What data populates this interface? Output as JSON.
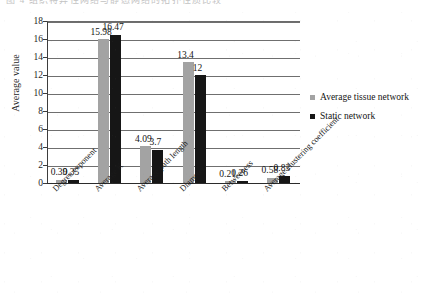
{
  "scan": {
    "top_cutoff_text": "图 4 组织特异性网络与静态网络的拓扑性质比较"
  },
  "chart_data": {
    "type": "bar",
    "title": "",
    "subtitle": "",
    "xlabel": "",
    "ylabel": "Average value",
    "ylim": [
      0,
      18
    ],
    "ytick_step": 2,
    "yticks": [
      0,
      2,
      4,
      6,
      8,
      10,
      12,
      14,
      16,
      18
    ],
    "ytick_labels": [
      "0",
      "2",
      "4",
      "6",
      "8",
      "10",
      "12",
      "14",
      "16",
      "18"
    ],
    "grid": "horizontal",
    "legend_position": "right",
    "categories": [
      "Degree exponent",
      "Average K",
      "Average path length",
      "Diameter",
      "Betweeness",
      "Average clustering coefficient"
    ],
    "series": [
      {
        "name": "Average tissue network",
        "color": "#a3a3a3",
        "values": [
          0.39,
          15.98,
          4.09,
          13.4,
          0.21,
          0.58
        ],
        "labels": [
          "0.39",
          "15.98",
          "4.09",
          "13.4",
          "0.21",
          "0.58"
        ]
      },
      {
        "name": "Static network",
        "color": "#161616",
        "values": [
          0.35,
          16.47,
          3.7,
          12,
          0.26,
          0.83
        ],
        "labels": [
          "0.35",
          "16.47",
          "3.7",
          "12",
          "0.26",
          "0.83"
        ]
      }
    ]
  },
  "legend": {
    "items": [
      {
        "label": "Average tissue network",
        "color": "#a3a3a3"
      },
      {
        "label": "Static network",
        "color": "#161616"
      }
    ]
  }
}
